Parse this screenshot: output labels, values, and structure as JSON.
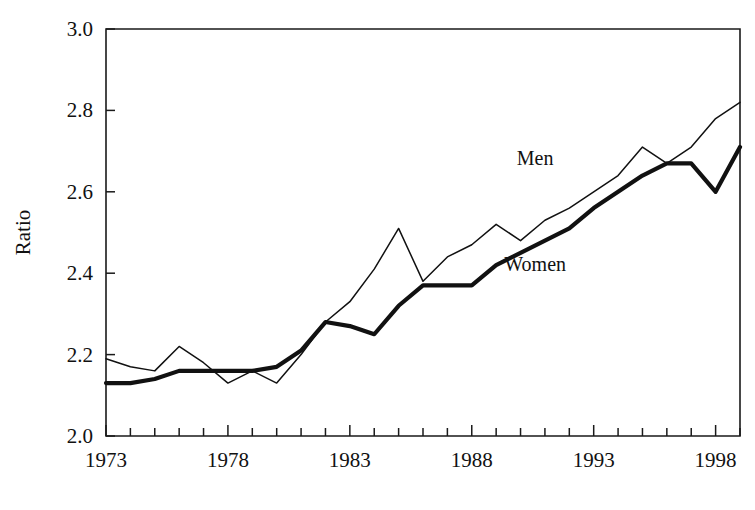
{
  "chart_data": {
    "type": "line",
    "title": "",
    "xlabel": "",
    "ylabel": "Ratio",
    "xlim": [
      1973,
      1999
    ],
    "ylim": [
      2.0,
      3.0
    ],
    "grid": false,
    "legend_position": "inline-annotation",
    "y_ticks": [
      "2.0",
      "2.2",
      "2.4",
      "2.6",
      "2.8",
      "3.0"
    ],
    "y_tick_values": [
      2.0,
      2.2,
      2.4,
      2.6,
      2.8,
      3.0
    ],
    "x_ticks": [
      "1973",
      "1978",
      "1983",
      "1988",
      "1993",
      "1998"
    ],
    "x_tick_values": [
      1973,
      1978,
      1983,
      1988,
      1993,
      1998
    ],
    "x_minor_tick_interval": 1,
    "x": [
      1973,
      1974,
      1975,
      1976,
      1977,
      1978,
      1979,
      1980,
      1981,
      1982,
      1983,
      1984,
      1985,
      1986,
      1987,
      1988,
      1989,
      1990,
      1991,
      1992,
      1993,
      1994,
      1995,
      1996,
      1997,
      1998,
      1999
    ],
    "series": [
      {
        "name": "Men",
        "style": "thin",
        "color": "#111111",
        "values": [
          2.19,
          2.17,
          2.16,
          2.22,
          2.18,
          2.13,
          2.16,
          2.13,
          2.2,
          2.28,
          2.33,
          2.41,
          2.51,
          2.38,
          2.44,
          2.47,
          2.52,
          2.48,
          2.53,
          2.56,
          2.6,
          2.64,
          2.71,
          2.67,
          2.71,
          2.78,
          2.82
        ]
      },
      {
        "name": "Women",
        "style": "thick",
        "color": "#111111",
        "values": [
          2.13,
          2.13,
          2.14,
          2.16,
          2.16,
          2.16,
          2.16,
          2.17,
          2.21,
          2.28,
          2.27,
          2.25,
          2.32,
          2.37,
          2.37,
          2.37,
          2.42,
          2.45,
          2.48,
          2.51,
          2.56,
          2.6,
          2.64,
          2.67,
          2.67,
          2.6,
          2.71
        ]
      }
    ],
    "annotations": [
      {
        "text": "Men",
        "x": 1990.6,
        "y": 2.665
      },
      {
        "text": "Women",
        "x": 1990.6,
        "y": 2.405
      }
    ]
  },
  "axes": {
    "y_axis_title": "Ratio"
  }
}
